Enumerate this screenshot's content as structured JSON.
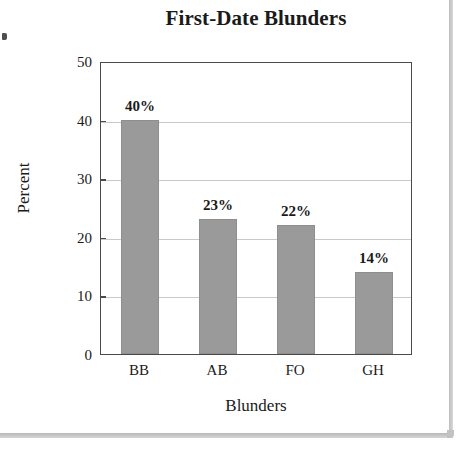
{
  "chart_data": {
    "type": "bar",
    "title": "First-Date Blunders",
    "xlabel": "Blunders",
    "ylabel": "Percent",
    "categories": [
      "BB",
      "AB",
      "FO",
      "GH"
    ],
    "values": [
      40,
      23,
      22,
      14
    ],
    "data_labels": [
      "40%",
      "23%",
      "22%",
      "14%"
    ],
    "ylim": [
      0,
      50
    ],
    "yticks": [
      0,
      10,
      20,
      30,
      40,
      50
    ],
    "ytick_labels": [
      "0",
      "10",
      "20",
      "30",
      "40",
      "50"
    ],
    "gridlines": [
      10,
      20,
      30,
      40
    ],
    "grid": true,
    "legend": null,
    "bar_color": "#9a9a9a",
    "frame_color": "#4a4a4a",
    "grid_color": "#c9c9c9"
  }
}
